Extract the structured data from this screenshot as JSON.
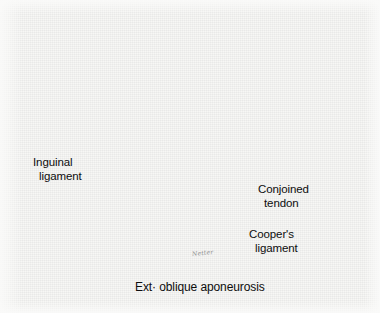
{
  "figure": {
    "kind": "medical-illustration",
    "medium": "grayscale halftone pen-and-ink drawing",
    "background_color": "#f7f7f5",
    "ink_color": "#141414",
    "width": 380,
    "height": 313
  },
  "labels": [
    {
      "id": "inguinal",
      "name": "inguinal-ligament-label",
      "line1": "Inguinal",
      "line2": "ligament",
      "position": {
        "x": 33,
        "y": 156
      },
      "leader": {
        "from": [
          103,
          175
        ],
        "to": [
          141,
          163
        ]
      }
    },
    {
      "id": "conjoined",
      "name": "conjoined-tendon-label",
      "line1": "Conjoined",
      "line2": "tendon",
      "position": {
        "x": 258,
        "y": 183
      },
      "leader": {
        "from": [
          256,
          188
        ],
        "to": [
          186,
          176
        ]
      }
    },
    {
      "id": "coopers",
      "name": "coopers-ligament-label",
      "line1": "Cooper's",
      "line2": "ligament",
      "position": {
        "x": 249,
        "y": 228
      },
      "leader": {
        "from": [
          247,
          233
        ],
        "to": [
          186,
          203
        ]
      }
    },
    {
      "id": "extoblique",
      "name": "ext-oblique-aponeurosis-label",
      "line1": "Ext· oblique  aponeurosis",
      "line2": "",
      "position": {
        "x": 135,
        "y": 281
      },
      "leader": {
        "from": [
          146,
          277
        ],
        "to": [
          172,
          224
        ]
      }
    }
  ],
  "signature": {
    "text": "Netter",
    "position": {
      "x": 192,
      "y": 249
    }
  },
  "anatomy": {
    "structures": [
      "Inguinal ligament",
      "Conjoined tendon",
      "Cooper's ligament",
      "External oblique aponeurosis"
    ],
    "instruments": [
      "multi-prong self-retaining retractor",
      "needle holder with suture"
    ],
    "sutures": "interrupted sutures placed between conjoined tendon and Cooper's ligament"
  }
}
